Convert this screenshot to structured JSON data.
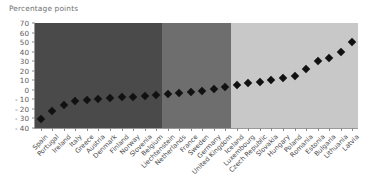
{
  "chart_data": {
    "type": "scatter",
    "title": "Percentage points",
    "xlabel": "",
    "ylabel": "Percentage points",
    "ylim": [
      -40,
      70
    ],
    "yticks": [
      70,
      60,
      50,
      40,
      30,
      20,
      10,
      0,
      -10,
      -20,
      -30,
      -40
    ],
    "ytick_labels": [
      "70",
      "60",
      "50",
      "40",
      "30",
      "20",
      "10",
      "0",
      "- 10",
      "- 20",
      "- 30",
      "- 40"
    ],
    "grid": false,
    "legend": "none",
    "marker_style": "filled-diamond",
    "marker_color": "#111111",
    "categories": [
      "Spain",
      "Portugal",
      "Ireland",
      "Italy",
      "Greece",
      "Austria",
      "Denmark",
      "Finland",
      "Norway",
      "Slovenia",
      "Belgium",
      "Liechtenstein",
      "Netherlands",
      "France",
      "Sweden",
      "Germany",
      "United Kingdom",
      "Iceland",
      "Luxembourg",
      "Czech Republic",
      "Slovakia",
      "Hungary",
      "Poland",
      "Romania",
      "Estonia",
      "Bulgaria",
      "Lithuania",
      "Latvia"
    ],
    "values": [
      -31,
      -22,
      -16,
      -12,
      -11,
      -10,
      -9,
      -8,
      -7,
      -6,
      -5,
      -4,
      -3,
      -2,
      -1,
      1,
      3,
      5,
      7,
      8,
      10,
      12,
      14,
      22,
      30,
      33,
      40,
      50
    ],
    "background_bands": [
      {
        "name": "band-dark",
        "color": "#4a4a4a",
        "start_index": 0,
        "end_index": 11
      },
      {
        "name": "band-medium",
        "color": "#6e6e6e",
        "start_index": 11,
        "end_index": 17
      },
      {
        "name": "band-light",
        "color": "#c8c8c8",
        "start_index": 17,
        "end_index": 28
      }
    ]
  }
}
